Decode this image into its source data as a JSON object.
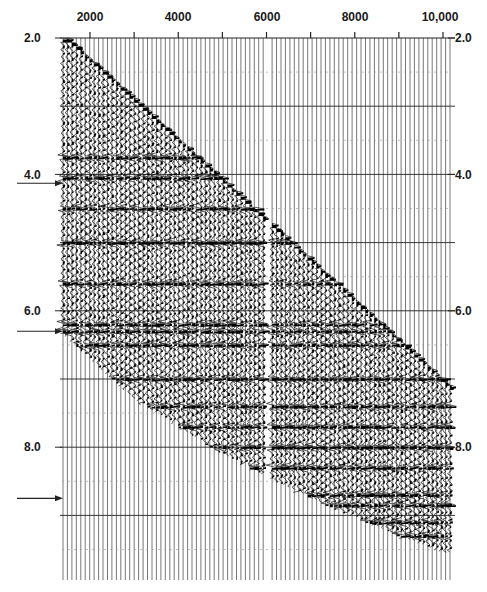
{
  "chart_data": {
    "type": "seismic-shot-gather",
    "title": "",
    "xlabel": "Offset",
    "ylabel": "Two-way time (s)",
    "x_ticks": [
      {
        "label": "2000",
        "value": 2000
      },
      {
        "label": "4000",
        "value": 4000
      },
      {
        "label": "6000",
        "value": 6000
      },
      {
        "label": "8000",
        "value": 8000
      },
      {
        "label": "10,000",
        "value": 10000
      }
    ],
    "y_ticks_left": [
      {
        "label": "2.0",
        "value": 2.0
      },
      {
        "label": "4.0",
        "value": 4.0
      },
      {
        "label": "6.0",
        "value": 6.0
      },
      {
        "label": "8.0",
        "value": 8.0
      }
    ],
    "y_ticks_right": [
      {
        "label": "2.0",
        "value": 2.0
      },
      {
        "label": "4.0",
        "value": 4.0
      },
      {
        "label": "6.0",
        "value": 6.0
      },
      {
        "label": "8.0",
        "value": 8.0
      }
    ],
    "xlim": [
      1400,
      10200
    ],
    "ylim": [
      2.0,
      10.0
    ],
    "timing_lines_s": [
      3.0,
      4.0,
      5.0,
      6.0,
      7.0,
      8.0,
      9.0
    ],
    "annotations": [
      {
        "type": "arrow",
        "time_s": 4.13,
        "side": "left"
      },
      {
        "type": "arrow",
        "time_s": 6.3,
        "side": "left"
      },
      {
        "type": "arrow",
        "time_s": 8.75,
        "side": "left"
      }
    ],
    "first_break_line": {
      "from": [
        1500,
        2.0
      ],
      "to": [
        10000,
        7.0
      ]
    },
    "mute_curve": [
      [
        1500,
        6.4
      ],
      [
        3000,
        7.3
      ],
      [
        5000,
        8.1
      ],
      [
        7000,
        8.75
      ],
      [
        9000,
        9.3
      ],
      [
        10000,
        9.55
      ]
    ],
    "dead_trace_offset": 6000,
    "grid": true,
    "legend": null
  }
}
